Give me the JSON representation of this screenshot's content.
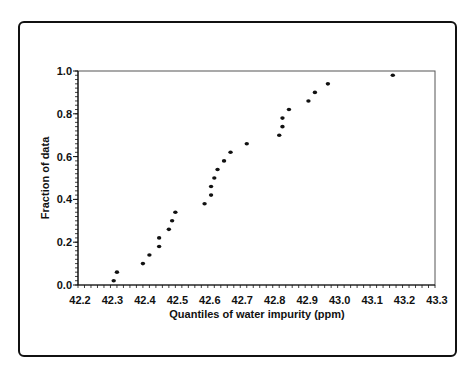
{
  "chart_data": {
    "type": "scatter",
    "title": "",
    "xlabel": "Quantiles of water impurity (ppm)",
    "ylabel": "Fraction of data",
    "xlim": [
      42.2,
      43.3
    ],
    "ylim": [
      0.0,
      1.0
    ],
    "x_ticks": [
      "42.2",
      "42.3",
      "42.4",
      "42.5",
      "42.6",
      "42.7",
      "42.8",
      "42.9",
      "43.0",
      "43.1",
      "43.2",
      "43.3"
    ],
    "y_ticks": [
      "0.0",
      "0.2",
      "0.4",
      "0.6",
      "0.8",
      "1.0"
    ],
    "grid": false,
    "legend": null,
    "points": [
      {
        "x": 42.31,
        "y": 0.02
      },
      {
        "x": 42.32,
        "y": 0.06
      },
      {
        "x": 42.4,
        "y": 0.1
      },
      {
        "x": 42.42,
        "y": 0.14
      },
      {
        "x": 42.45,
        "y": 0.18
      },
      {
        "x": 42.45,
        "y": 0.22
      },
      {
        "x": 42.48,
        "y": 0.26
      },
      {
        "x": 42.49,
        "y": 0.3
      },
      {
        "x": 42.5,
        "y": 0.34
      },
      {
        "x": 42.59,
        "y": 0.38
      },
      {
        "x": 42.61,
        "y": 0.42
      },
      {
        "x": 42.61,
        "y": 0.46
      },
      {
        "x": 42.62,
        "y": 0.5
      },
      {
        "x": 42.63,
        "y": 0.54
      },
      {
        "x": 42.65,
        "y": 0.58
      },
      {
        "x": 42.67,
        "y": 0.62
      },
      {
        "x": 42.72,
        "y": 0.66
      },
      {
        "x": 42.82,
        "y": 0.7
      },
      {
        "x": 42.83,
        "y": 0.74
      },
      {
        "x": 42.83,
        "y": 0.78
      },
      {
        "x": 42.85,
        "y": 0.82
      },
      {
        "x": 42.91,
        "y": 0.86
      },
      {
        "x": 42.93,
        "y": 0.9
      },
      {
        "x": 42.97,
        "y": 0.94
      },
      {
        "x": 43.17,
        "y": 0.98
      }
    ]
  }
}
